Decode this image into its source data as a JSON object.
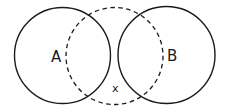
{
  "diagram": {
    "type": "venn",
    "stroke_color": "#1a1a1a",
    "background": "#ffffff",
    "circles": [
      {
        "id": "A",
        "style": "solid",
        "cx": 62.5,
        "cy": 55.5,
        "r": 48
      },
      {
        "id": "B",
        "style": "solid",
        "cx": 166.5,
        "cy": 55,
        "r": 48.5
      },
      {
        "id": "X",
        "style": "dashed",
        "cx": 114.5,
        "cy": 56,
        "r": 48.5
      }
    ],
    "labels": {
      "a": "A",
      "b": "B",
      "x": "x"
    }
  }
}
